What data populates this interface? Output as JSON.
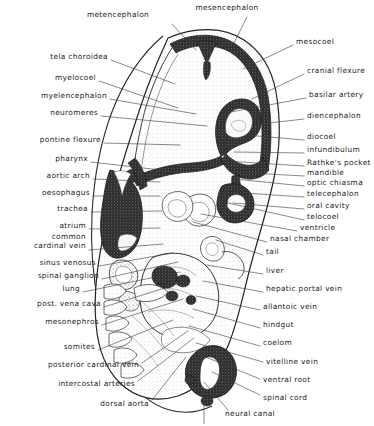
{
  "figure": {
    "width": 374,
    "height": 426,
    "background": "#ffffff",
    "ink": "#1b1b1b",
    "leader_color": "#3a3a3a"
  },
  "labels": {
    "left": [
      {
        "id": "tela-choroidea",
        "text": "tela choroidea",
        "x": 108,
        "y": 57,
        "lx": 111,
        "ly": 60,
        "tx": 175,
        "ty": 84
      },
      {
        "id": "myelocoel",
        "text": "myelocoel",
        "x": 96,
        "y": 78,
        "lx": 99,
        "ly": 81,
        "tx": 178,
        "ty": 108
      },
      {
        "id": "myelencephalon",
        "text": "myelencephalon",
        "x": 107,
        "y": 96,
        "lx": 110,
        "ly": 99,
        "tx": 196,
        "ty": 114
      },
      {
        "id": "neuromeres",
        "text": "neuromeres",
        "x": 98,
        "y": 113,
        "lx": 101,
        "ly": 116,
        "tx": 207,
        "ty": 126
      },
      {
        "id": "pontine-flexure",
        "text": "pontine flexure",
        "x": 101,
        "y": 140,
        "lx": 104,
        "ly": 143,
        "tx": 180,
        "ty": 145
      },
      {
        "id": "pharynx",
        "text": "pharynx",
        "x": 88,
        "y": 159,
        "lx": 91,
        "ly": 162,
        "tx": 178,
        "ty": 172
      },
      {
        "id": "aortic-arch",
        "text": "aortic arch",
        "x": 90,
        "y": 176,
        "lx": 93,
        "ly": 179,
        "tx": 160,
        "ty": 182
      },
      {
        "id": "oesophagus",
        "text": "oesophagus",
        "x": 90,
        "y": 193,
        "lx": 93,
        "ly": 196,
        "tx": 160,
        "ty": 196
      },
      {
        "id": "trachea",
        "text": "trachea",
        "x": 88,
        "y": 209,
        "lx": 91,
        "ly": 212,
        "tx": 162,
        "ty": 211
      },
      {
        "id": "atrium",
        "text": "atrium",
        "x": 86,
        "y": 226,
        "lx": 89,
        "ly": 229,
        "tx": 160,
        "ty": 228
      },
      {
        "id": "common-cardinal-vein",
        "text": "common\ncardinal vein",
        "x": 86,
        "y": 236,
        "lx": 89,
        "ly": 250,
        "tx": 163,
        "ty": 244
      },
      {
        "id": "sinus-venosus",
        "text": "sinus venosus",
        "x": 96,
        "y": 263,
        "lx": 99,
        "ly": 266,
        "tx": 173,
        "ty": 253
      },
      {
        "id": "spinal-ganglion",
        "text": "spinal ganglion",
        "x": 99,
        "y": 276,
        "lx": 102,
        "ly": 279,
        "tx": 178,
        "ty": 262
      },
      {
        "id": "lung",
        "text": "lung",
        "x": 80,
        "y": 289,
        "lx": 83,
        "ly": 292,
        "tx": 180,
        "ty": 272
      },
      {
        "id": "post-vena-cava",
        "text": "post. vena cava",
        "x": 101,
        "y": 304,
        "lx": 104,
        "ly": 307,
        "tx": 184,
        "ty": 282
      },
      {
        "id": "mesonephros",
        "text": "mesonephros",
        "x": 99,
        "y": 322,
        "lx": 102,
        "ly": 325,
        "tx": 183,
        "ty": 299
      },
      {
        "id": "somites",
        "text": "somites",
        "x": 95,
        "y": 347,
        "lx": 98,
        "ly": 350,
        "tx": 173,
        "ty": 320
      },
      {
        "id": "posterior-cardinal-vein",
        "text": "posterior cardinal vein",
        "x": 139,
        "y": 365,
        "lx": 142,
        "ly": 363,
        "tx": 188,
        "ty": 331
      },
      {
        "id": "intercostal-arteries",
        "text": "intercostal arteries",
        "x": 135,
        "y": 384,
        "lx": 138,
        "ly": 381,
        "tx": 194,
        "ty": 338
      },
      {
        "id": "dorsal-aorta",
        "text": "dorsal aorta",
        "x": 149,
        "y": 404,
        "lx": 152,
        "ly": 400,
        "tx": 186,
        "ty": 357
      }
    ],
    "top": [
      {
        "id": "metencephalon",
        "text": "metencephalon",
        "x": 118,
        "y": 15,
        "lx": 172,
        "ly": 24,
        "tx": 196,
        "ty": 50
      },
      {
        "id": "mesencephalon",
        "text": "mesencephalon",
        "x": 227,
        "y": 8,
        "lx": 247,
        "ly": 17,
        "tx": 233,
        "ty": 45
      }
    ],
    "right": [
      {
        "id": "mesocoel",
        "text": "mesocoel",
        "x": 296,
        "y": 42,
        "lx": 293,
        "ly": 45,
        "tx": 243,
        "ty": 69
      },
      {
        "id": "cranial-flexure",
        "text": "cranial flexure",
        "x": 307,
        "y": 71,
        "lx": 304,
        "ly": 74,
        "tx": 252,
        "ty": 99
      },
      {
        "id": "basilar-artery",
        "text": "basilar artery",
        "x": 309,
        "y": 95,
        "lx": 306,
        "ly": 98,
        "tx": 231,
        "ty": 112
      },
      {
        "id": "diencephalon",
        "text": "diencephalon",
        "x": 307,
        "y": 116,
        "lx": 304,
        "ly": 119,
        "tx": 269,
        "ty": 123
      },
      {
        "id": "diocoel",
        "text": "diocoel",
        "x": 307,
        "y": 137,
        "lx": 304,
        "ly": 140,
        "tx": 246,
        "ty": 135
      },
      {
        "id": "infundibulum",
        "text": "infundibulum",
        "x": 307,
        "y": 150,
        "lx": 304,
        "ly": 153,
        "tx": 234,
        "ty": 152
      },
      {
        "id": "rathkes-pocket",
        "text": "Rathke's pocket",
        "x": 307,
        "y": 163,
        "lx": 304,
        "ly": 166,
        "tx": 226,
        "ty": 161
      },
      {
        "id": "mandible",
        "text": "mandible",
        "x": 307,
        "y": 173,
        "lx": 304,
        "ly": 176,
        "tx": 231,
        "ty": 172
      },
      {
        "id": "optic-chiasma",
        "text": "optic chiasma",
        "x": 307,
        "y": 183,
        "lx": 304,
        "ly": 186,
        "tx": 234,
        "ty": 179
      },
      {
        "id": "telecephalon",
        "text": "telecephalon",
        "x": 307,
        "y": 194,
        "lx": 304,
        "ly": 197,
        "tx": 244,
        "ty": 193
      },
      {
        "id": "oral-cavity",
        "text": "oral cavity",
        "x": 307,
        "y": 206,
        "lx": 304,
        "ly": 209,
        "tx": 233,
        "ty": 203
      },
      {
        "id": "telocoel",
        "text": "telocoel",
        "x": 307,
        "y": 217,
        "lx": 304,
        "ly": 220,
        "tx": 228,
        "ty": 203
      },
      {
        "id": "ventricle",
        "text": "ventricle",
        "x": 300,
        "y": 228,
        "lx": 297,
        "ly": 231,
        "tx": 201,
        "ty": 214
      },
      {
        "id": "nasal-chamber",
        "text": "nasal chamber",
        "x": 270,
        "y": 239,
        "lx": 267,
        "ly": 242,
        "tx": 193,
        "ty": 222
      },
      {
        "id": "tail",
        "text": "tail",
        "x": 266,
        "y": 252,
        "lx": 263,
        "ly": 255,
        "tx": 216,
        "ty": 240
      },
      {
        "id": "liver",
        "text": "liver",
        "x": 266,
        "y": 271,
        "lx": 263,
        "ly": 274,
        "tx": 206,
        "ty": 265
      },
      {
        "id": "hepatic-portal-vein",
        "text": "hepatic portal vein",
        "x": 266,
        "y": 289,
        "lx": 263,
        "ly": 292,
        "tx": 203,
        "ty": 281
      },
      {
        "id": "allantoic-vein",
        "text": "allantoic vein",
        "x": 263,
        "y": 307,
        "lx": 260,
        "ly": 310,
        "tx": 196,
        "ty": 296
      },
      {
        "id": "hindgut",
        "text": "hindgut",
        "x": 263,
        "y": 325,
        "lx": 260,
        "ly": 328,
        "tx": 193,
        "ty": 309
      },
      {
        "id": "coelom",
        "text": "coelom",
        "x": 263,
        "y": 343,
        "lx": 260,
        "ly": 346,
        "tx": 189,
        "ty": 326
      },
      {
        "id": "vitelline-vein",
        "text": "vitelline vein",
        "x": 266,
        "y": 362,
        "lx": 263,
        "ly": 362,
        "tx": 196,
        "ty": 343
      },
      {
        "id": "ventral-root",
        "text": "ventral root",
        "x": 263,
        "y": 380,
        "lx": 260,
        "ly": 379,
        "tx": 203,
        "ty": 356
      },
      {
        "id": "spinal-cord",
        "text": "spinal cord",
        "x": 263,
        "y": 398,
        "lx": 260,
        "ly": 395,
        "tx": 212,
        "ty": 372
      },
      {
        "id": "neural-canal",
        "text": "neural canal",
        "x": 225,
        "y": 414,
        "lx": 228,
        "ly": 410,
        "tx": 204,
        "ty": 382
      }
    ]
  },
  "anatomy": {
    "structures": [
      "amnion outline",
      "brain neural tube with metencephalon, mesencephalon, diencephalon, telencephalon",
      "pharynx and aortic arches",
      "heart atrium and sinus venosus",
      "liver and gut",
      "somites and spinal cord",
      "coelom and body wall"
    ]
  }
}
